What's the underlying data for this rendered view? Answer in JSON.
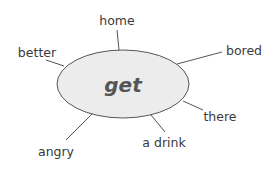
{
  "diagram": {
    "type": "word-spider",
    "center": {
      "label": "get",
      "fill": "#ececec",
      "stroke": "#555555"
    },
    "collocations": [
      {
        "label": "home"
      },
      {
        "label": "better"
      },
      {
        "label": "bored"
      },
      {
        "label": "there"
      },
      {
        "label": "a drink"
      },
      {
        "label": "angry"
      }
    ]
  }
}
